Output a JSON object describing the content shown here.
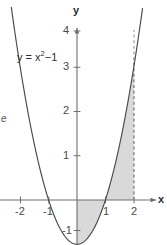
{
  "figure": {
    "title": "",
    "axis_labels": {
      "x": "x",
      "y": "y"
    },
    "curve_label": {
      "prefix": "y = x",
      "exponent": "2",
      "suffix": "−1",
      "full": "y = x²−1"
    },
    "margin_note": "e",
    "colors": {
      "curve": "#4a4a4a",
      "axis": "#6e6e6e",
      "fill": "#d9d9d9",
      "fill_stroke": "#bdbdbd",
      "dashed": "#8c8c8c",
      "text": "#3b3b3b",
      "background": "#ffffff"
    }
  },
  "chart_data": {
    "type": "line",
    "title": "",
    "xlabel": "x",
    "ylabel": "y",
    "xlim": [
      -2.7,
      2.9
    ],
    "ylim": [
      -1.45,
      4.35
    ],
    "grid": false,
    "legend": null,
    "annotations": [
      {
        "text": "y = x²−1",
        "x": -1.7,
        "y": 3.0
      },
      {
        "text": "e",
        "x": -2.65,
        "y": 1.85
      }
    ],
    "xticks": [
      -2,
      -1,
      1,
      2
    ],
    "xtick_labels": [
      "-2",
      "-1",
      "1",
      "2"
    ],
    "yticks": [
      1,
      2,
      3,
      4,
      -1
    ],
    "ytick_labels": [
      "1",
      "2",
      "3",
      "4",
      "-1"
    ],
    "series": [
      {
        "name": "y = x²−1",
        "equation": "y = x^2 - 1",
        "x": [
          -2.28,
          -2.1,
          -1.9,
          -1.7,
          -1.5,
          -1.3,
          -1.1,
          -1.0,
          -0.9,
          -0.7,
          -0.5,
          -0.3,
          -0.1,
          0,
          0.1,
          0.3,
          0.5,
          0.7,
          0.9,
          1.0,
          1.1,
          1.3,
          1.5,
          1.7,
          1.9,
          2.1,
          2.28
        ],
        "values": [
          4.2,
          3.41,
          2.61,
          1.89,
          1.25,
          0.69,
          0.21,
          0,
          -0.19,
          -0.51,
          -0.75,
          -0.91,
          -0.99,
          -1,
          -0.99,
          -0.91,
          -0.75,
          -0.51,
          -0.19,
          0,
          0.21,
          0.69,
          1.25,
          1.89,
          2.61,
          3.41,
          4.2
        ]
      }
    ],
    "shaded_regions": [
      {
        "name": "below-axis-region",
        "x_from": 0,
        "x_to": 1,
        "between": "curve-and-x-axis",
        "sign": "negative",
        "color": "#d9d9d9"
      },
      {
        "name": "above-axis-region",
        "x_from": 1,
        "x_to": 2,
        "between": "curve-and-x-axis",
        "sign": "positive",
        "color": "#d9d9d9"
      }
    ],
    "reference_lines": [
      {
        "name": "vertical-dashed-x2",
        "type": "vertical",
        "x": 2,
        "style": "dashed",
        "color": "#8c8c8c"
      }
    ]
  }
}
